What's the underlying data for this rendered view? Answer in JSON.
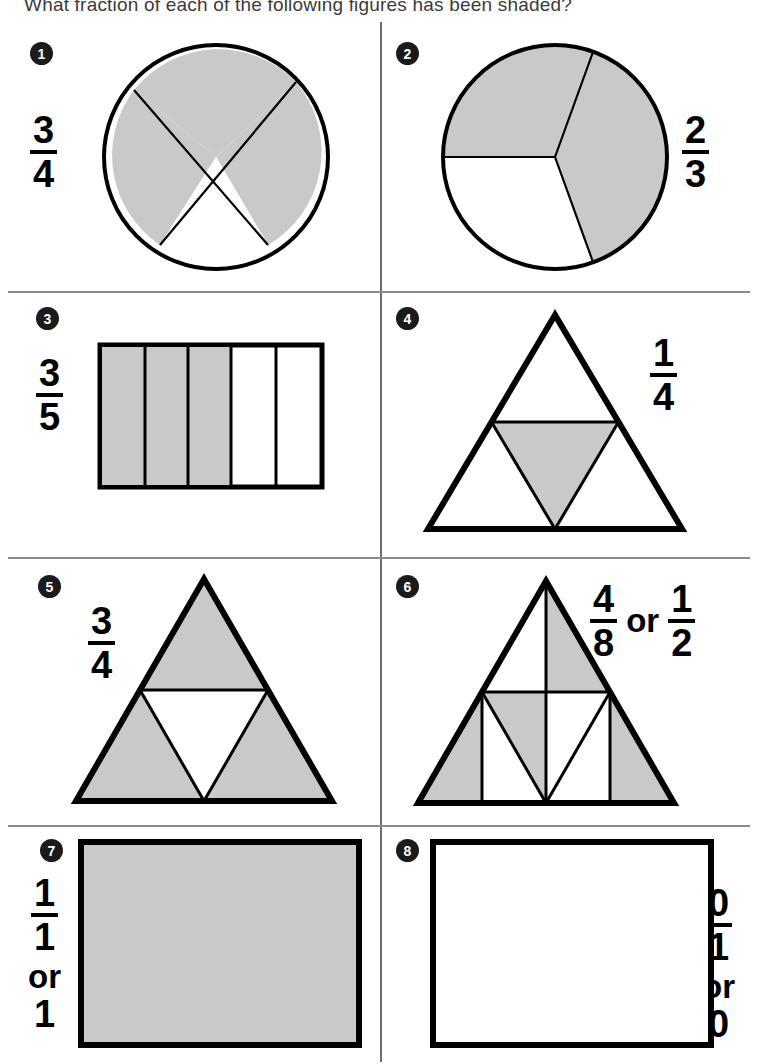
{
  "header": {
    "question": "What fraction of each of the following figures has been shaded?"
  },
  "colors": {
    "shade": "#c9c9c9",
    "outline": "#000000",
    "rule": "#8a8a8a",
    "bullet_bg": "#1b1b1b"
  },
  "figures": [
    {
      "number": "1",
      "shape": "circle",
      "parts": 4,
      "shaded": 3,
      "fraction": {
        "numerator": "3",
        "denominator": "4"
      },
      "fraction_side": "left",
      "description": "circle cut into four quarters by two rotated diameters, three quarters shaded"
    },
    {
      "number": "2",
      "shape": "circle",
      "parts": 3,
      "shaded": 2,
      "fraction": {
        "numerator": "2",
        "denominator": "3"
      },
      "fraction_side": "right",
      "description": "circle cut into three equal sectors, two sectors shaded"
    },
    {
      "number": "3",
      "shape": "rectangle-columns",
      "parts": 5,
      "shaded": 3,
      "fraction": {
        "numerator": "3",
        "denominator": "5"
      },
      "fraction_side": "left",
      "description": "rectangle split into five vertical strips, first three shaded"
    },
    {
      "number": "4",
      "shape": "triangle",
      "parts": 4,
      "shaded": 1,
      "fraction": {
        "numerator": "1",
        "denominator": "4"
      },
      "fraction_side": "right",
      "description": "triangle split into four small triangles, the central inverted one shaded"
    },
    {
      "number": "5",
      "shape": "triangle",
      "parts": 4,
      "shaded": 3,
      "fraction": {
        "numerator": "3",
        "denominator": "4"
      },
      "fraction_side": "left",
      "description": "triangle split into four small triangles, three corner triangles shaded"
    },
    {
      "number": "6",
      "shape": "triangle",
      "parts": 8,
      "shaded": 4,
      "fraction": {
        "numerator": "4",
        "denominator": "8"
      },
      "or_text": "or",
      "fraction_alt": {
        "numerator": "1",
        "denominator": "2"
      },
      "fraction_side": "right",
      "description": "triangle split into eight pieces, four shaded"
    },
    {
      "number": "7",
      "shape": "rectangle",
      "parts": 1,
      "shaded": 1,
      "fraction": {
        "numerator": "1",
        "denominator": "1"
      },
      "or_text": "or",
      "whole_value": "1",
      "fraction_side": "left",
      "description": "rectangle completely shaded"
    },
    {
      "number": "8",
      "shape": "rectangle",
      "parts": 1,
      "shaded": 0,
      "fraction": {
        "numerator": "0",
        "denominator": "1"
      },
      "or_text": "or",
      "whole_value": "0",
      "fraction_side": "right",
      "description": "rectangle with no shading"
    }
  ]
}
